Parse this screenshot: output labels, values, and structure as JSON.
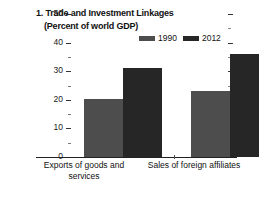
{
  "chart_data": {
    "type": "bar",
    "title": "1. Trade and Investment Linkages",
    "subtitle": "(Percent of world GDP)",
    "xlabel": "",
    "ylabel": "",
    "ylim": [
      0,
      50
    ],
    "ytick_major_step": 10,
    "ytick_minor_step": 5,
    "grid": false,
    "legend_position": "top-right",
    "categories": [
      "Exports of goods and services",
      "Sales of foreign affiliates"
    ],
    "series": [
      {
        "name": "1990",
        "color": "#4d4d4d",
        "values": [
          20.3,
          23.0
        ]
      },
      {
        "name": "2012",
        "color": "#262626",
        "values": [
          31.0,
          36.0
        ]
      }
    ],
    "yticks": [
      {
        "value": 50,
        "label": "50",
        "major": true
      },
      {
        "value": 45,
        "label": "",
        "major": false
      },
      {
        "value": 40,
        "label": "40",
        "major": true
      },
      {
        "value": 35,
        "label": "",
        "major": false
      },
      {
        "value": 30,
        "label": "30",
        "major": true
      },
      {
        "value": 25,
        "label": "",
        "major": false
      },
      {
        "value": 20,
        "label": "20",
        "major": true
      },
      {
        "value": 15,
        "label": "",
        "major": false
      },
      {
        "value": 10,
        "label": "10",
        "major": true
      },
      {
        "value": 5,
        "label": "",
        "major": false
      },
      {
        "value": 0,
        "label": "0",
        "major": true
      }
    ]
  },
  "colors": {
    "background": "#ffffff",
    "axis": "#222222",
    "text": "#111111",
    "series_1990": "#4d4d4d",
    "series_2012": "#262626"
  }
}
